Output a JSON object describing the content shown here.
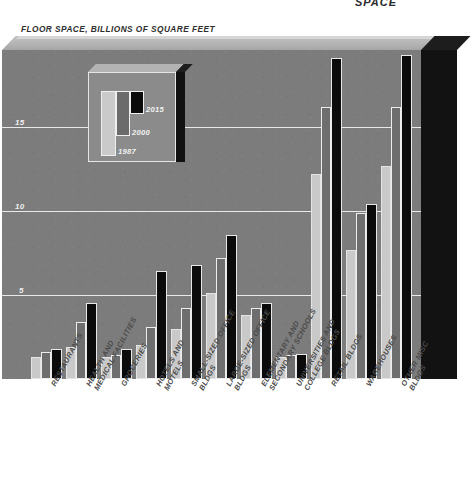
{
  "header": {
    "clipped_text": "SPACE"
  },
  "chart_title": "FLOOR SPACE, BILLIONS OF SQUARE FEET",
  "axis": {
    "yticks": [
      "15",
      "10",
      "5"
    ],
    "ytick_values": [
      15,
      10,
      5
    ]
  },
  "legend": {
    "items": [
      {
        "label": "1987",
        "color": "#c9c9c9"
      },
      {
        "label": "2000",
        "color": "#6e6e6e"
      },
      {
        "label": "2015",
        "color": "#0b0b0b"
      }
    ]
  },
  "colors": {
    "plot_background": "#7c7c7c",
    "gridline": "#e9e9e9",
    "series_1987": "#c9c9c9",
    "series_2000": "#6e6e6e",
    "series_2015": "#0b0b0b",
    "side_panel": "#121212",
    "label_text": "#4a4a4a"
  },
  "chart_data": {
    "type": "bar",
    "title": "FLOOR SPACE, BILLIONS OF SQUARE FEET",
    "xlabel": "",
    "ylabel": "FLOOR SPACE, BILLIONS OF SQUARE FEET",
    "ylim": [
      0,
      19.5
    ],
    "yticks": [
      5,
      10,
      15
    ],
    "grid": true,
    "legend_position": "inside-upper-left",
    "categories": [
      "RESTAURANTS",
      "HEALTH AND MEDICAL FACILITIES",
      "GROCERIES",
      "HOTELS AND MOTELS",
      "SMALL-SIZED OFFICE BLDGS",
      "LARGE-SIZED OFFICE BLDGS",
      "ELEMENTARY AND SECONDARY SCHOOLS",
      "UNIVERSITIES AND COLLEGE BLDGS",
      "RETAIL BLDGS",
      "WAREHOUSES",
      "OTHER MISC BLDGS"
    ],
    "series": [
      {
        "name": "1987",
        "values": [
          1.3,
          1.9,
          1.3,
          2.0,
          3.0,
          5.1,
          3.8,
          1.3,
          12.2,
          7.7,
          12.7
        ]
      },
      {
        "name": "2000",
        "values": [
          1.6,
          3.4,
          1.4,
          3.1,
          4.2,
          7.2,
          4.2,
          1.4,
          16.2,
          9.9,
          16.2
        ]
      },
      {
        "name": "2015",
        "values": [
          1.8,
          4.5,
          1.8,
          6.4,
          6.8,
          8.6,
          4.5,
          1.5,
          19.1,
          10.4,
          19.3
        ]
      }
    ]
  }
}
